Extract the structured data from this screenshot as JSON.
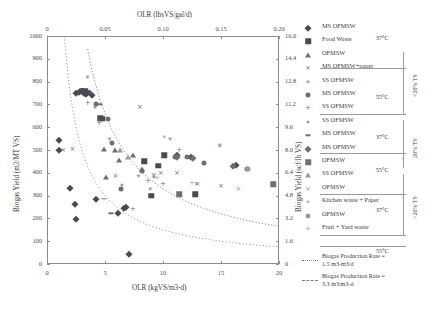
{
  "chart_data": {
    "type": "scatter",
    "title": "",
    "xlabel": "OLR  (kgVS/m3-d)",
    "xlabel_top": "OLR (lbsVS/gal/d)",
    "ylabel": "Biogas Yield (m3/MT VS)",
    "ylabel_right": "Biogas Yield (scf/lb VS)",
    "xlim": [
      0,
      20
    ],
    "ylim": [
      0,
      1000
    ],
    "xlim_top": [
      0,
      0.2
    ],
    "ylim_right": [
      0,
      16.0
    ],
    "xticks": [
      "0",
      "5",
      "10",
      "15",
      "20"
    ],
    "xticks_top": [
      "0",
      "0.05",
      "0.10",
      "0.15",
      "0.20"
    ],
    "yticks": [
      "0",
      "100",
      "200",
      "300",
      "400",
      "500",
      "600",
      "700",
      "800",
      "900",
      "1000"
    ],
    "yticks_right": [
      "0",
      "1.6",
      "3.2",
      "4.8",
      "6.4",
      "8.0",
      "9.6",
      "11.2",
      "12.8",
      "14.4",
      "16.0"
    ],
    "grid": false,
    "legend_position": "right",
    "series": [
      {
        "name": "MS OFMSW",
        "marker": "diamond",
        "temp": "37°C",
        "ts_group": "<20% TS",
        "points": [
          [
            1.0,
            500
          ],
          [
            2.5,
            750
          ],
          [
            2.8,
            755
          ],
          [
            3.0,
            760
          ],
          [
            3.2,
            750
          ],
          [
            3.4,
            745
          ],
          [
            3.9,
            740
          ],
          [
            2.0,
            335
          ],
          [
            2.4,
            262
          ],
          [
            2.5,
            196
          ],
          [
            4.2,
            285
          ],
          [
            6.1,
            225
          ],
          [
            6.6,
            245
          ],
          [
            6.8,
            250
          ],
          [
            7.1,
            42
          ],
          [
            1.0,
            545
          ],
          [
            11.2,
            480
          ],
          [
            12.4,
            470
          ],
          [
            16.3,
            435
          ]
        ]
      },
      {
        "name": "Food Waste",
        "marker": "square",
        "temp": "37°C",
        "ts_group": "<20% TS",
        "points": [
          [
            3.0,
            757
          ],
          [
            3.3,
            760
          ],
          [
            3.6,
            752
          ],
          [
            4.6,
            640
          ],
          [
            4.8,
            638
          ],
          [
            8.4,
            450
          ],
          [
            9.6,
            430
          ],
          [
            12.8,
            307
          ],
          [
            10.1,
            478
          ],
          [
            9.0,
            300
          ]
        ]
      },
      {
        "name": "OFMSW",
        "marker": "triangle",
        "temp": "37°C",
        "ts_group": "<20% TS",
        "points": [
          [
            5.9,
            500
          ],
          [
            6.2,
            455
          ],
          [
            7.4,
            480
          ],
          [
            4.9,
            505
          ],
          [
            8.2,
            415
          ],
          [
            5.1,
            380
          ]
        ]
      },
      {
        "name": "MS OFMSW+paper",
        "marker": "x",
        "temp": "37°C",
        "ts_group": "<20% TS",
        "points": [
          [
            1.4,
            498
          ],
          [
            2.2,
            505
          ],
          [
            9.8,
            400
          ],
          [
            11.2,
            398
          ],
          [
            12.9,
            352
          ],
          [
            15.0,
            340
          ],
          [
            5.9,
            385
          ],
          [
            9.2,
            390
          ],
          [
            8.0,
            690
          ]
        ]
      },
      {
        "name": "SS OFMSW",
        "marker": "star",
        "temp": "37°C",
        "ts_group": "<20% TS",
        "points": [
          [
            3.5,
            822
          ],
          [
            10.6,
            550
          ],
          [
            14.9,
            518
          ],
          [
            5.4,
            548
          ],
          [
            7.9,
            385
          ],
          [
            8.9,
            330
          ]
        ]
      },
      {
        "name": "MS OFMSW",
        "marker": "circle",
        "temp": "55°C",
        "ts_group": "<20% TS",
        "points": [
          [
            4.2,
            700
          ],
          [
            5.3,
            638
          ],
          [
            5.6,
            530
          ],
          [
            8.2,
            410
          ],
          [
            11.0,
            468
          ],
          [
            13.5,
            445
          ],
          [
            17.2,
            415
          ],
          [
            6.4,
            330
          ],
          [
            12.1,
            470
          ]
        ]
      },
      {
        "name": "SS OFMSW",
        "marker": "plus",
        "temp": "55°C",
        "ts_group": "<20% TS",
        "points": [
          [
            3.5,
            705
          ],
          [
            4.5,
            620
          ],
          [
            10.0,
            350
          ],
          [
            11.4,
            500
          ],
          [
            8.7,
            365
          ],
          [
            7.4,
            240
          ]
        ]
      },
      {
        "name": "SS OFMSW",
        "marker": "dot-sm",
        "temp": "37°C",
        "ts_group": "20% TS",
        "points": [
          [
            4.1,
            690
          ],
          [
            6.5,
            345
          ],
          [
            9.2,
            380
          ]
        ]
      },
      {
        "name": "MS OFMSW",
        "marker": "dash",
        "temp": "37°C",
        "ts_group": "20% TS",
        "points": [
          [
            4.6,
            700
          ],
          [
            4.9,
            285
          ],
          [
            5.5,
            222
          ]
        ]
      },
      {
        "name": "MS OFMSW",
        "marker": "diamond2",
        "temp": "55°C",
        "ts_group": "20% TS",
        "points": [
          [
            11.2,
            470
          ],
          [
            12.6,
            465
          ],
          [
            16.0,
            430
          ]
        ]
      },
      {
        "name": "OFMSW",
        "marker": "square2",
        "temp": "37°C",
        "ts_group": ">20% TS",
        "points": [
          [
            11.4,
            305
          ],
          [
            19.5,
            350
          ]
        ]
      },
      {
        "name": "SS OFMSW",
        "marker": "triangle2",
        "temp": "37°C",
        "ts_group": ">20% TS",
        "points": [
          [
            6.3,
            498
          ],
          [
            7.0,
            470
          ]
        ]
      },
      {
        "name": "OFMSW",
        "marker": "x2",
        "temp": "55°C",
        "ts_group": ">20% TS",
        "points": [
          [
            13.0,
            352
          ],
          [
            16.5,
            330
          ]
        ]
      },
      {
        "name": "Kitchen waste + Paper",
        "marker": "star2",
        "temp": "55°C",
        "ts_group": ">20% TS",
        "points": [
          [
            10.1,
            555
          ],
          [
            14.9,
            520
          ]
        ]
      },
      {
        "name": "OFMSW",
        "marker": "circle2",
        "temp": "55°C",
        "ts_group": ">20% TS",
        "points": [
          [
            17.3,
            418
          ]
        ]
      },
      {
        "name": "Fruit + Yard waste",
        "marker": "plus2",
        "temp": "55°C",
        "ts_group": ">20% TS",
        "points": [
          [
            9.5,
            378
          ],
          [
            12.5,
            355
          ]
        ]
      }
    ],
    "curves": [
      {
        "name": "Biogas Production Rate = 1.5 m3-m3/d",
        "style": "dotted",
        "label_line1": "Biogas Production Rate =",
        "label_line2": "1.5 m3-m3/d"
      },
      {
        "name": "Biogas Production Rate = 3.3 m3/m3-d",
        "style": "dashed",
        "label_line1": "Biogas Production Rate =",
        "label_line2": "3.3 m3/m3-d"
      }
    ]
  },
  "legend": {
    "entries": [
      {
        "label": "MS OFMSW",
        "marker": "diamond"
      },
      {
        "label": "Food Waste",
        "marker": "square"
      },
      {
        "label": "OFMSW",
        "marker": "triangle"
      },
      {
        "label": "MS OFMSW+paper",
        "marker": "x"
      },
      {
        "label": "SS OFMSW",
        "marker": "star"
      },
      {
        "label": "MS OFMSW",
        "marker": "circle"
      },
      {
        "label": "SS OFMSW",
        "marker": "plus"
      },
      {
        "label": "SS OFMSW",
        "marker": "dot-sm"
      },
      {
        "label": "MS OFMSW",
        "marker": "dash"
      },
      {
        "label": "MS OFMSW",
        "marker": "diamond2"
      },
      {
        "label": "OFMSW",
        "marker": "square2"
      },
      {
        "label": "SS OFMSW",
        "marker": "triangle2"
      },
      {
        "label": "OFMSW",
        "marker": "x2"
      },
      {
        "label": "Kitchen waste + Paper",
        "marker": "star2"
      },
      {
        "label": "OFMSW",
        "marker": "circle2"
      },
      {
        "label": "Fruit + Yard waste",
        "marker": "plus2"
      }
    ],
    "temps": [
      "37°C",
      "55°C",
      "37°C",
      "55°C",
      "37°C",
      "55°C"
    ],
    "ts_groups": [
      "<20% TS",
      "20% TS",
      ">20% TS"
    ],
    "curve_entries": [
      {
        "l1": "Biogas Production Rate =",
        "l2": "1.5 m3-m3/d"
      },
      {
        "l1": "Biogas Production Rate =",
        "l2": "3.3 m3/m3-d"
      }
    ]
  },
  "colors": {
    "marker_dark": "#4a4a52",
    "marker_mid": "#6e6e78",
    "marker_light": "#9a9aa2",
    "axis": "#8a8a99",
    "text": "#3a3a3a"
  }
}
